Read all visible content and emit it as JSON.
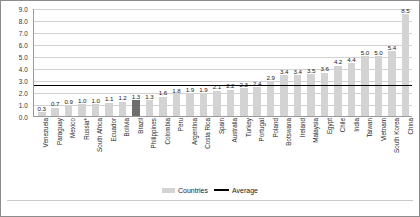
{
  "chart_data": {
    "type": "bar",
    "title": "",
    "xlabel": "",
    "ylabel": "",
    "ylim": [
      0,
      9
    ],
    "ytick_step": 1,
    "grid": true,
    "legend_position": "bottom",
    "categories": [
      "Venezuela",
      "Paraguay",
      "Mexico",
      "Russia*",
      "South Africa",
      "Ecuador",
      "Bolivia",
      "Brazil",
      "Philippines",
      "Colombia",
      "Peru",
      "Argentina",
      "Costa Rica",
      "Spain",
      "Australia",
      "Turkey",
      "Portugal",
      "Poland",
      "Botswana",
      "Ireland",
      "Malaysia",
      "Egypt",
      "Chile",
      "India",
      "Taiwan",
      "Vietnam",
      "South Korea",
      "China"
    ],
    "values": [
      0.3,
      0.7,
      0.9,
      1.0,
      1.0,
      1.1,
      1.2,
      1.3,
      1.3,
      1.6,
      1.8,
      1.9,
      1.9,
      2.1,
      2.2,
      2.3,
      2.4,
      2.9,
      3.4,
      3.4,
      3.5,
      3.6,
      4.2,
      4.4,
      5.0,
      5.0,
      5.4,
      8.5
    ],
    "value_labels": [
      "0.3",
      "0.7",
      "0.9",
      "1.0",
      "1.0",
      "1.1",
      "1.2",
      "1.3",
      "1.3",
      "1.6",
      "1.8",
      "1.9",
      "1.9",
      "2.1",
      "2.2",
      "2.3",
      "2.4",
      "2.9",
      "3.4",
      "3.4",
      "3.5",
      "3.6",
      "4.2",
      "4.4",
      "5.0",
      "5.0",
      "5.4",
      "8.5"
    ],
    "highlight_index": 7,
    "average": 2.7,
    "ytick_labels": [
      "9.0",
      "8.0",
      "7.0",
      "6.0",
      "5.0",
      "4.0",
      "3.0",
      "2.0",
      "1.0",
      "0.0"
    ],
    "ytick_values": [
      9,
      8,
      7,
      6,
      5,
      4,
      3,
      2,
      1,
      0
    ],
    "legend": [
      {
        "label": "Countries",
        "type": "box",
        "color": "#d3d3d3"
      },
      {
        "label": "Average",
        "type": "line",
        "color": "#000000"
      }
    ]
  },
  "colors": {
    "bar": "#d3d3d3",
    "bar_highlight": "#6e6e6e",
    "average_line": "#000000",
    "grid": "#d2d2d2",
    "axis": "#9a9a9a",
    "text": "#1a1a1a",
    "frame": "#8c8c8c",
    "background": "#ffffff"
  }
}
